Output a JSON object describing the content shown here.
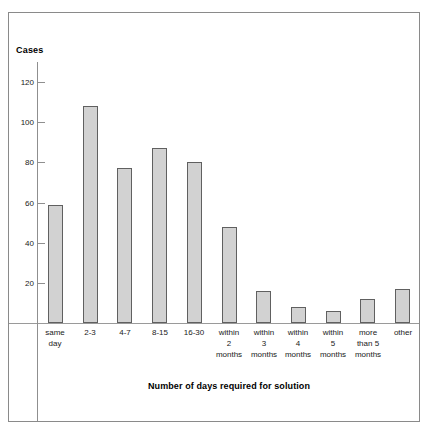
{
  "chart_data": {
    "type": "bar",
    "title": "",
    "xlabel": "Number of days required for solution",
    "ylabel": "Cases",
    "categories": [
      "same day",
      "2-3",
      "4-7",
      "8-15",
      "16-30",
      "within 2 months",
      "within 3 months",
      "within 4 months",
      "within 5 months",
      "more than 5 months",
      "other"
    ],
    "category_lines": [
      [
        "same",
        "day"
      ],
      [
        "2-3"
      ],
      [
        "4-7"
      ],
      [
        "8-15"
      ],
      [
        "16-30"
      ],
      [
        "within",
        "2",
        "months"
      ],
      [
        "within",
        "3",
        "months"
      ],
      [
        "within",
        "4",
        "months"
      ],
      [
        "within",
        "5",
        "months"
      ],
      [
        "more",
        "than 5",
        "months"
      ],
      [
        "other"
      ]
    ],
    "values": [
      59,
      108,
      77,
      87,
      80,
      48,
      16,
      8,
      6,
      12,
      17
    ],
    "ylim": [
      0,
      130
    ],
    "yticks": [
      20,
      40,
      60,
      80,
      100,
      120
    ],
    "ytick_labels": [
      "20",
      "40",
      "60",
      "80",
      "100",
      "120"
    ],
    "grid": false,
    "legend": "none",
    "bar_fill_color": "#d2d2d2",
    "bar_edge_color": "#606060",
    "axis_color": "#8f8f8f",
    "frame_color": "#8a8a8a",
    "text_color": "#1a1a1a"
  }
}
